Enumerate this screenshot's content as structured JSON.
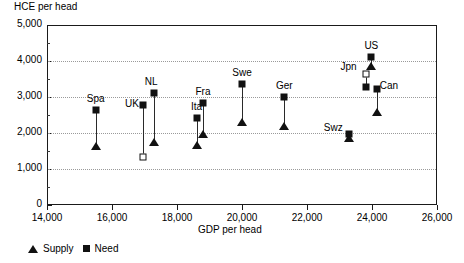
{
  "chart_data": {
    "type": "scatter",
    "title": "",
    "ylabel": "HCE per head",
    "xlabel": "GDP per head",
    "xlim": [
      14000,
      26000
    ],
    "ylim": [
      0,
      5000
    ],
    "xticks": [
      "14,000",
      "16,000",
      "18,000",
      "20,000",
      "22,000",
      "24,000",
      "26,000"
    ],
    "xtick_values": [
      14000,
      16000,
      18000,
      20000,
      22000,
      24000,
      26000
    ],
    "yticks": [
      "0",
      "1,000",
      "2,000",
      "3,000",
      "4,000",
      "5,000"
    ],
    "ytick_values": [
      0,
      1000,
      2000,
      3000,
      4000,
      5000
    ],
    "y_minor_step": 500,
    "grid": "horizontal-dotted",
    "legend_position": "below-axis-left",
    "series": [
      {
        "name": "Supply",
        "marker": "triangle"
      },
      {
        "name": "Need",
        "marker": "square"
      }
    ],
    "points": [
      {
        "label": "Spa",
        "gdp": 15500,
        "need": 2650,
        "supply": 1680,
        "need_open": false,
        "supply_open": false,
        "label_dx": 0,
        "label_dy": -6
      },
      {
        "label": "UK",
        "gdp": 16950,
        "need": 2780,
        "supply": 1320,
        "need_open": false,
        "supply_open": true,
        "label_dx": -11,
        "label_dy": 4
      },
      {
        "label": "NL",
        "gdp": 17300,
        "need": 3120,
        "supply": 1790,
        "need_open": false,
        "supply_open": false,
        "label_dx": -3,
        "label_dy": -6
      },
      {
        "label": "Ita",
        "gdp": 18600,
        "need": 2420,
        "supply": 1700,
        "need_open": false,
        "supply_open": false,
        "label_dx": 0,
        "label_dy": -6
      },
      {
        "label": "Fra",
        "gdp": 18800,
        "need": 2820,
        "supply": 2000,
        "need_open": false,
        "supply_open": false,
        "label_dx": 0,
        "label_dy": -6
      },
      {
        "label": "Swe",
        "gdp": 20000,
        "need": 3350,
        "supply": 2320,
        "need_open": false,
        "supply_open": false,
        "label_dx": 0,
        "label_dy": -6
      },
      {
        "label": "Ger",
        "gdp": 21300,
        "need": 3000,
        "supply": 2220,
        "need_open": false,
        "supply_open": false,
        "label_dx": 0,
        "label_dy": -6
      },
      {
        "label": "Swz",
        "gdp": 23300,
        "need": 1980,
        "supply": 1880,
        "need_open": false,
        "supply_open": false,
        "label_dx": -16,
        "label_dy": -1
      },
      {
        "label": "Jpn",
        "gdp": 23800,
        "need": 3270,
        "supply": 3650,
        "need_open": false,
        "supply_open": true,
        "label_dx": -17,
        "label_dy": -2
      },
      {
        "label": "US",
        "gdp": 23980,
        "need": 4120,
        "supply": 3900,
        "need_open": false,
        "supply_open": false,
        "label_dx": 0,
        "label_dy": -6
      },
      {
        "label": "Can",
        "gdp": 24150,
        "need": 3230,
        "supply": 2620,
        "need_open": false,
        "supply_open": false,
        "label_dx": 12,
        "label_dy": 2
      }
    ]
  },
  "legend": {
    "supply_label": "Supply",
    "need_label": "Need"
  }
}
